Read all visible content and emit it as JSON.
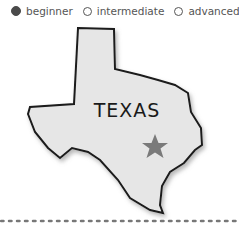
{
  "level_selector": {
    "options": [
      {
        "label": "beginner",
        "checked": true
      },
      {
        "label": "intermediate",
        "checked": false
      },
      {
        "label": "advanced",
        "checked": false
      }
    ]
  },
  "image": {
    "label": "TEXAS",
    "state_color": "#e6e6e6",
    "outline_color": "#1a1a1a",
    "star_color": "#7a7a7a"
  }
}
